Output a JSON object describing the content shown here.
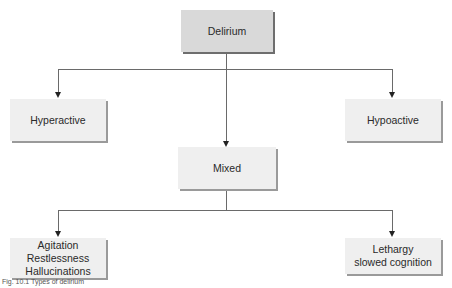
{
  "diagram": {
    "root": {
      "label": "Delirium"
    },
    "level1": [
      {
        "label": "Hyperactive"
      },
      {
        "label": "Mixed"
      },
      {
        "label": "Hypoactive"
      }
    ],
    "level2": [
      {
        "lines": [
          "Agitation",
          "Restlessness",
          "Hallucinations"
        ]
      },
      {
        "lines": [
          "Lethargy",
          "slowed cognition"
        ]
      }
    ],
    "caption": "Fig. 10.1 Types of delirium",
    "colors": {
      "root_fill": "#d9d9d9",
      "box_fill": "#efefef",
      "line": "#6a6a6a"
    }
  }
}
